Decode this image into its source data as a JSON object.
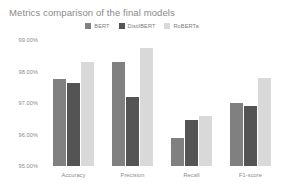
{
  "chart_data": {
    "type": "bar",
    "title": "Metrics comparison of the final models",
    "xlabel": "",
    "ylabel": "",
    "categories": [
      "Accuracy",
      "Precision",
      "Recall",
      "F1-score"
    ],
    "series": [
      {
        "name": "BERT",
        "color": "#808080",
        "values": [
          97.75,
          98.3,
          95.9,
          97.0
        ]
      },
      {
        "name": "DistilBERT",
        "color": "#545454",
        "values": [
          97.65,
          97.2,
          96.45,
          96.9
        ]
      },
      {
        "name": "RoBERTa",
        "color": "#d9d9d9",
        "values": [
          98.3,
          98.75,
          96.6,
          97.8
        ]
      }
    ],
    "ylim": [
      95.0,
      99.0
    ],
    "yticks": [
      99.0,
      98.0,
      97.0,
      96.0,
      95.0
    ],
    "ytick_labels": [
      "99.00%",
      "98.00%",
      "97.00%",
      "96.00%",
      "95.00%"
    ],
    "grid": false,
    "legend_position": "top-center",
    "value_suffix": "%"
  }
}
